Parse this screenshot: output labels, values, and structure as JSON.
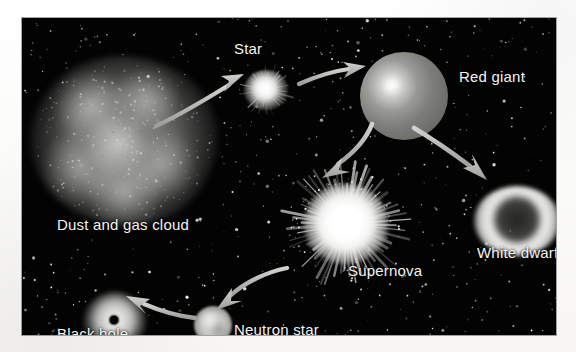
{
  "figure": {
    "background_color": "#ffffff",
    "panel_color": "#030303",
    "label_color": "#f4f4f2",
    "arrow_color": "#b9b9b6"
  },
  "stages": [
    {
      "id": "dust-cloud",
      "label": "Dust and gas cloud",
      "shape": "irregular-nebula-blob",
      "center": [
        102,
        123
      ],
      "size": [
        188,
        170
      ]
    },
    {
      "id": "star",
      "label": "Star",
      "shape": "small-glowing-sphere",
      "center": [
        244,
        72
      ],
      "size": [
        44,
        40
      ]
    },
    {
      "id": "red-giant",
      "label": "Red giant",
      "shape": "large-sphere-offset-hotspot",
      "center": [
        382,
        78
      ],
      "size": [
        88,
        88
      ]
    },
    {
      "id": "supernova",
      "label": "Supernova",
      "shape": "radiating-starburst",
      "center": [
        324,
        206
      ],
      "size": [
        132,
        128
      ]
    },
    {
      "id": "white-dwarf",
      "label": "White dwarf",
      "shape": "bright-ring-annulus",
      "center": [
        495,
        203
      ],
      "size": [
        86,
        70
      ]
    },
    {
      "id": "neutron-star",
      "label": "Neutron star",
      "shape": "small-mottled-sphere",
      "center": [
        191,
        307
      ],
      "size": [
        38,
        38
      ]
    },
    {
      "id": "black-hole",
      "label": "Black hole",
      "shape": "glowing-halo-with-dark-center",
      "center": [
        93,
        303
      ],
      "size": [
        62,
        58
      ]
    }
  ],
  "arrows": [
    {
      "id": "arrow-cloud-to-star",
      "from": "dust-cloud",
      "to": "star",
      "direction": "up-right"
    },
    {
      "id": "arrow-star-to-red-giant",
      "from": "star",
      "to": "red-giant",
      "direction": "right"
    },
    {
      "id": "arrow-giant-to-supernova",
      "from": "red-giant",
      "to": "supernova",
      "direction": "down-left"
    },
    {
      "id": "arrow-giant-to-white-dwarf",
      "from": "red-giant",
      "to": "white-dwarf",
      "direction": "down-right"
    },
    {
      "id": "arrow-supernova-to-neutron",
      "from": "supernova",
      "to": "neutron-star",
      "direction": "down-left"
    },
    {
      "id": "arrow-neutron-to-black-hole",
      "from": "neutron-star",
      "to": "black-hole",
      "direction": "left"
    }
  ]
}
